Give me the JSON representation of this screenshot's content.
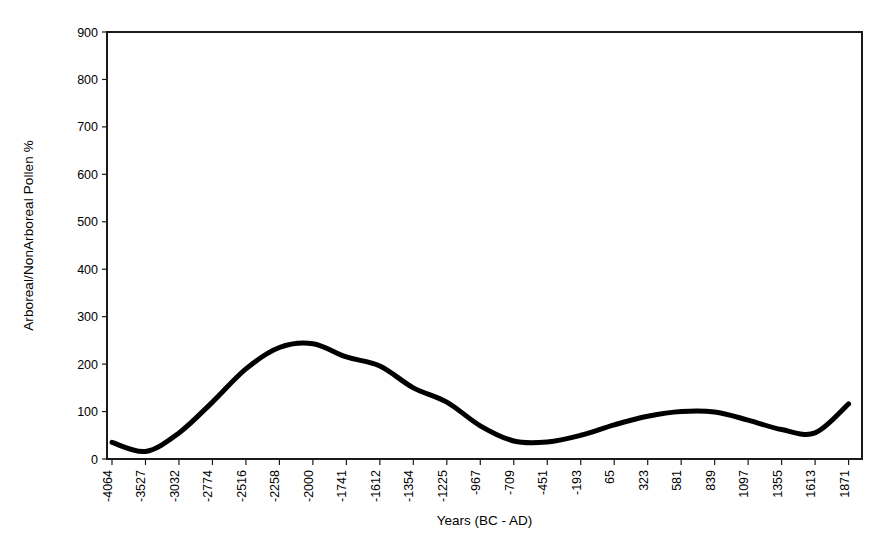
{
  "chart_data": {
    "type": "line",
    "title": "",
    "xlabel": "Years (BC - AD)",
    "ylabel": "Arboreal/NonArboreal Pollen %",
    "ylim": [
      0,
      900
    ],
    "yticks": [
      0,
      100,
      200,
      300,
      400,
      500,
      600,
      700,
      800,
      900
    ],
    "grid": false,
    "legend": false,
    "line_color": "#000000",
    "categories": [
      "-4064",
      "-3527",
      "-3032",
      "-2774",
      "-2516",
      "-2258",
      "-2000",
      "-1741",
      "-1612",
      "-1354",
      "-1225",
      "-967",
      "-709",
      "-451",
      "-193",
      "65",
      "323",
      "581",
      "839",
      "1097",
      "1355",
      "1613",
      "1871"
    ],
    "series": [
      {
        "name": "Arboreal/NonArboreal Pollen %",
        "values": [
          35,
          16,
          55,
          120,
          190,
          235,
          243,
          215,
          196,
          150,
          120,
          70,
          38,
          36,
          50,
          72,
          90,
          100,
          99,
          82,
          62,
          55,
          116
        ]
      }
    ]
  },
  "axes": {
    "y_axis_title": "Arboreal/NonArboreal Pollen %",
    "x_axis_title": "Years (BC - AD)"
  }
}
